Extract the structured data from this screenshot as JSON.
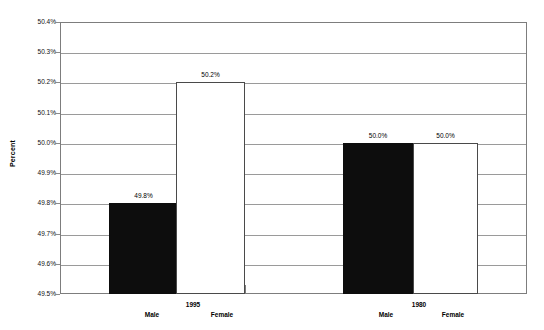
{
  "chart_data": {
    "type": "bar",
    "title": "",
    "subtitle": "",
    "xlabel": "",
    "ylabel": "Percent",
    "ylim": [
      49.5,
      50.4
    ],
    "ytick_step": 0.1,
    "ytick_labels": [
      "50.4%",
      "50.3%",
      "50.2%",
      "50.1%",
      "50.0%",
      "49.9%",
      "49.8%",
      "49.7%",
      "49.6%",
      "49.5%"
    ],
    "ytick_values": [
      50.4,
      50.3,
      50.2,
      50.1,
      50.0,
      49.9,
      49.8,
      49.7,
      49.6,
      49.5
    ],
    "grid": true,
    "legend": "none",
    "groups": [
      {
        "group_label": "1995",
        "bars": [
          {
            "category": "Male",
            "value": 49.8,
            "value_label": "49.8%",
            "style": "filled"
          },
          {
            "category": "Female",
            "value": 50.2,
            "value_label": "50.2%",
            "style": "hollow"
          }
        ]
      },
      {
        "group_label": "1980",
        "bars": [
          {
            "category": "Male",
            "value": 50.0,
            "value_label": "50.0%",
            "style": "filled"
          },
          {
            "category": "Female",
            "value": 50.0,
            "value_label": "50.0%",
            "style": "hollow"
          }
        ]
      }
    ],
    "colors": {
      "filled_bar": "#0d0d0d",
      "hollow_bar": "#ffffff",
      "bar_outline": "#4a4a4a",
      "gridline": "#9a9a9a",
      "axis": "#7d7d7d",
      "text": "#000000",
      "background": "#ffffff"
    }
  },
  "layout": {
    "plot": {
      "left": 60,
      "top": 22,
      "width": 467,
      "height": 272
    },
    "bar_geometry": [
      {
        "left": 49,
        "width": 69
      },
      {
        "left": 116,
        "width": 69
      },
      {
        "left": 283,
        "width": 70
      },
      {
        "left": 353,
        "width": 65
      }
    ],
    "group_tick_x": 245,
    "category_label_x": [
      152,
      222,
      386,
      453
    ],
    "category_label_y": 311,
    "group_label_x": [
      193,
      419
    ],
    "group_label_y": 301
  }
}
